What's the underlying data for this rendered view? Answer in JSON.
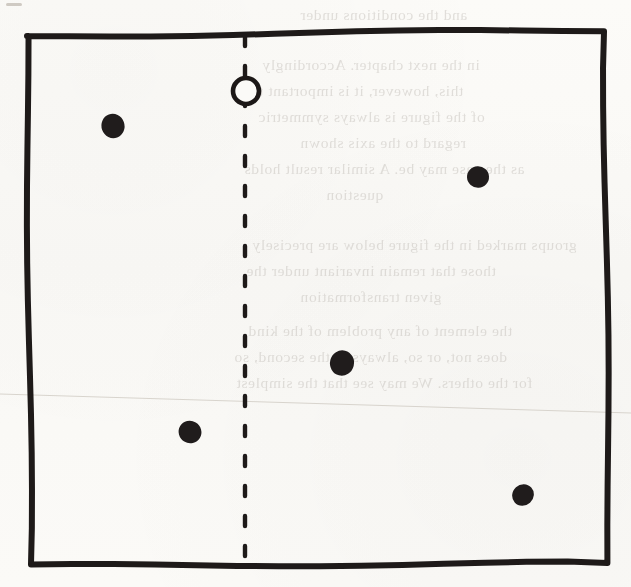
{
  "figure": {
    "medium": "scanned book page, black ink on off-white paper",
    "background_color": "#fbfaf7",
    "ink_color": "#1e1a19",
    "width": 631,
    "height": 587
  },
  "frame": {
    "name": "rectangle-border",
    "description": "Hand-drawn rectangle, slightly irregular, drawn with a thick pen stroke",
    "stroke_width": 6,
    "corners": {
      "top_left": [
        27,
        36
      ],
      "top_right": [
        604,
        30
      ],
      "bottom_right": [
        609,
        563
      ],
      "bottom_left": [
        31,
        566
      ]
    }
  },
  "axis": {
    "name": "vertical-dashed-axis",
    "description": "Vertical dashed line dividing the rectangle into left and right halves",
    "x": 245,
    "y_start": 36,
    "y_end": 563,
    "stroke_width": 4.4,
    "dash_length": 10,
    "gap_length": 20
  },
  "open_circle": {
    "name": "open-circle-marker",
    "cx": 246,
    "cy": 91,
    "r": 13,
    "fill": "none",
    "description": "Unfilled circle sitting on the dashed axis near the top of the rectangle"
  },
  "dots": [
    {
      "id": "dot-upper-left",
      "cx": 113,
      "cy": 126,
      "r": 11.5,
      "side": "left"
    },
    {
      "id": "dot-upper-right",
      "cx": 478,
      "cy": 177,
      "r": 11.0,
      "side": "right"
    },
    {
      "id": "dot-center-right",
      "cx": 342,
      "cy": 363,
      "r": 12.0,
      "side": "right"
    },
    {
      "id": "dot-lower-left",
      "cx": 190,
      "cy": 432,
      "r": 11.5,
      "side": "left"
    },
    {
      "id": "dot-lower-right",
      "cx": 523,
      "cy": 495,
      "r": 10.5,
      "side": "right"
    }
  ],
  "artifacts": {
    "crease": {
      "name": "scan-crease-line",
      "description": "Very faint thin line crossing the page from left to right",
      "x1": 0,
      "y1": 394,
      "x2": 631,
      "y2": 413,
      "color": "#d8d4cd"
    },
    "top_left_speck": {
      "name": "ink-speck",
      "x": 6,
      "y": 3,
      "w": 16,
      "h": 3
    }
  },
  "bleed_through": {
    "description": "Faint mirrored ghost of text printed on the reverse side of the page",
    "color": "#b9b4ae",
    "lines": [
      {
        "top": 6,
        "left": 300,
        "text": "and the conditions under"
      },
      {
        "top": 56,
        "left": 262,
        "text": "in the next chapter. Accordingly"
      },
      {
        "top": 82,
        "left": 250,
        "text": "this, however, it is important to"
      },
      {
        "top": 108,
        "left": 258,
        "text": "of the figure is always symmetric"
      },
      {
        "top": 134,
        "left": 300,
        "text": "regard to the axis shown"
      },
      {
        "top": 160,
        "left": 244,
        "text": "as the case may be. A similar result holds"
      },
      {
        "top": 186,
        "left": 326,
        "text": "question"
      },
      {
        "top": 236,
        "left": 252,
        "text": "groups marked in the figure below are precisely"
      },
      {
        "top": 262,
        "left": 246,
        "text": "those that remain invariant under the"
      },
      {
        "top": 288,
        "left": 300,
        "text": "given transformation"
      },
      {
        "top": 322,
        "left": 248,
        "text": "the element of any problem of the kind"
      },
      {
        "top": 348,
        "left": 234,
        "text": "does not, or so, always to the second, so"
      },
      {
        "top": 374,
        "left": 236,
        "text": "for the others. We may see that the simplest"
      }
    ]
  }
}
